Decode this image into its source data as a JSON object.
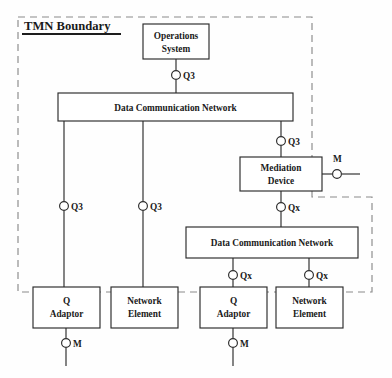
{
  "diagram": {
    "title": "TMN Boundary",
    "type": "network-architecture-block-diagram",
    "boundary": {
      "label": "TMN Boundary",
      "style": "dashed",
      "color": "#8a8a8a"
    },
    "colors": {
      "box_stroke": "#2a2a2a",
      "box_fill": "#ffffff",
      "line": "#2a2a2a",
      "boundary_dash": "#8a8a8a",
      "text": "#1a1a1a",
      "page_background": "#fefefe"
    },
    "nodes": [
      {
        "id": "operations-system",
        "lines": [
          "Operations",
          "System"
        ],
        "x": 143,
        "y": 24,
        "w": 66,
        "h": 35
      },
      {
        "id": "data-communication-network-top",
        "lines": [
          "Data Communication Network"
        ],
        "x": 58,
        "y": 93,
        "w": 235,
        "h": 28
      },
      {
        "id": "mediation-device",
        "lines": [
          "Mediation",
          "Device"
        ],
        "x": 240,
        "y": 157,
        "w": 82,
        "h": 34
      },
      {
        "id": "data-communication-network-bottom",
        "lines": [
          "Data Communication Network"
        ],
        "x": 186,
        "y": 227,
        "w": 172,
        "h": 31
      },
      {
        "id": "q-adaptor-left",
        "lines": [
          "Q",
          "Adaptor"
        ],
        "x": 33,
        "y": 287,
        "w": 67,
        "h": 41
      },
      {
        "id": "network-element-left",
        "lines": [
          "Network",
          "Element"
        ],
        "x": 111,
        "y": 287,
        "w": 67,
        "h": 41
      },
      {
        "id": "q-adaptor-right",
        "lines": [
          "Q",
          "Adaptor"
        ],
        "x": 200,
        "y": 287,
        "w": 67,
        "h": 41
      },
      {
        "id": "network-element-right",
        "lines": [
          "Network",
          "Element"
        ],
        "x": 276,
        "y": 287,
        "w": 67,
        "h": 41
      }
    ],
    "interfaces": [
      {
        "id": "q3-os-dcn",
        "label": "Q3",
        "cx": 176,
        "cy": 75,
        "lx": 183,
        "ly": 79
      },
      {
        "id": "q3-dcn-md",
        "label": "Q3",
        "cx": 281,
        "cy": 141,
        "lx": 288,
        "ly": 145
      },
      {
        "id": "m-mediation",
        "label": "M",
        "cx": 337,
        "cy": 174,
        "lx": 333,
        "ly": 162
      },
      {
        "id": "qx-md-dcn2",
        "label": "Qx",
        "cx": 281,
        "cy": 207,
        "lx": 288,
        "ly": 211
      },
      {
        "id": "q3-qa-left",
        "label": "Q3",
        "cx": 64,
        "cy": 206,
        "lx": 71,
        "ly": 210
      },
      {
        "id": "q3-ne-left",
        "label": "Q3",
        "cx": 143,
        "cy": 206,
        "lx": 150,
        "ly": 210
      },
      {
        "id": "qx-qa-right",
        "label": "Qx",
        "cx": 233,
        "cy": 275,
        "lx": 240,
        "ly": 279
      },
      {
        "id": "qx-ne-right",
        "label": "Qx",
        "cx": 309,
        "cy": 275,
        "lx": 316,
        "ly": 279
      },
      {
        "id": "m-qa-left",
        "label": "M",
        "cx": 66,
        "cy": 343,
        "lx": 73,
        "ly": 347
      },
      {
        "id": "m-qa-right",
        "label": "M",
        "cx": 233,
        "cy": 343,
        "lx": 240,
        "ly": 347
      }
    ],
    "connections": [
      {
        "id": "os-to-q3",
        "d": "M 176 59 L 176 70"
      },
      {
        "id": "q3-to-dcn-top",
        "d": "M 176 80 L 176 93"
      },
      {
        "id": "dcn-top-to-q3-md",
        "d": "M 281 121 L 281 136"
      },
      {
        "id": "q3-md-to-md",
        "d": "M 281 146 L 281 157"
      },
      {
        "id": "md-to-m",
        "d": "M 322 174 L 332 174"
      },
      {
        "id": "m-to-right-end",
        "d": "M 342 174 L 360 174"
      },
      {
        "id": "md-to-qx",
        "d": "M 281 191 L 281 202"
      },
      {
        "id": "qx-to-dcn-bottom",
        "d": "M 281 212 L 281 227"
      },
      {
        "id": "dcn-top-to-q3-left",
        "d": "M 64 121 L 64 201"
      },
      {
        "id": "q3-left-to-qa",
        "d": "M 64 211 L 64 287"
      },
      {
        "id": "dcn-top-to-q3-ne",
        "d": "M 143 121 L 143 201"
      },
      {
        "id": "q3-ne-to-ne",
        "d": "M 143 211 L 143 287"
      },
      {
        "id": "dcn-bot-to-qx-qa",
        "d": "M 233 258 L 233 270"
      },
      {
        "id": "qx-qa-to-qa",
        "d": "M 233 280 L 233 287"
      },
      {
        "id": "dcn-bot-to-qx-ne",
        "d": "M 309 258 L 309 270"
      },
      {
        "id": "qx-ne-to-ne",
        "d": "M 309 280 L 309 287"
      },
      {
        "id": "qa-left-to-m",
        "d": "M 66 328 L 66 338"
      },
      {
        "id": "m-left-tail",
        "d": "M 66 348 L 66 366"
      },
      {
        "id": "qa-right-to-m",
        "d": "M 233 328 L 233 338"
      },
      {
        "id": "m-right-tail",
        "d": "M 233 348 L 233 366"
      }
    ],
    "boundary_path": "M 18 17 L 312 17 L 312 197 L 372 197 L 372 292 L 18 292 L 18 17",
    "title_underline": {
      "x1": 22,
      "y1": 34,
      "x2": 121,
      "y2": 34
    },
    "title_position": {
      "x": 24,
      "y": 30
    }
  }
}
